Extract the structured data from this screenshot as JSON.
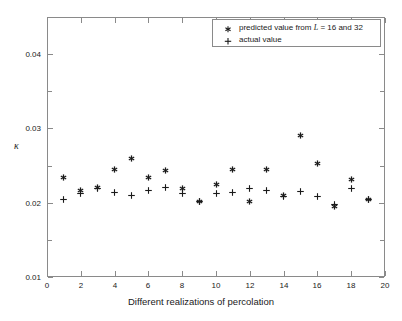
{
  "chart_data": {
    "type": "scatter",
    "title": "",
    "xlabel": "Different realizations of percolation",
    "ylabel": "κ",
    "xlim": [
      0,
      20
    ],
    "ylim": [
      0.01,
      0.045
    ],
    "xticks": [
      0,
      2,
      4,
      6,
      8,
      10,
      12,
      14,
      16,
      18,
      20
    ],
    "xtick_labels": [
      "0",
      "2",
      "4",
      "6",
      "8",
      "10",
      "12",
      "14",
      "16",
      "18",
      "20"
    ],
    "yticks": [
      0.01,
      0.02,
      0.03,
      0.04
    ],
    "ytick_labels": [
      "0.01",
      "0.02",
      "0.03",
      "0.04"
    ],
    "y_minor_ticks": [
      0.015,
      0.025,
      0.035,
      0.045
    ],
    "grid": false,
    "legend_position": "top-right",
    "x": [
      1,
      2,
      3,
      4,
      5,
      6,
      7,
      8,
      9,
      10,
      11,
      12,
      13,
      14,
      15,
      16,
      17,
      18,
      19
    ],
    "series": [
      {
        "name": "predicted value from L = 16 and 32",
        "marker": "star",
        "color": "#1a1a1a",
        "values": [
          0.0234,
          0.0216,
          0.022,
          0.0245,
          0.026,
          0.0234,
          0.0243,
          0.0219,
          0.0201,
          0.0225,
          0.0245,
          0.0201,
          0.0245,
          0.021,
          0.029,
          0.0253,
          0.0195,
          0.0231,
          0.0204
        ]
      },
      {
        "name": "actual value",
        "marker": "plus",
        "color": "#1a1a1a",
        "values": [
          0.0205,
          0.0212,
          0.0219,
          0.0214,
          0.021,
          0.0217,
          0.0221,
          0.0212,
          0.0201,
          0.0213,
          0.0214,
          0.0219,
          0.0217,
          0.0208,
          0.0215,
          0.0208,
          0.0197,
          0.0219,
          0.0204
        ]
      }
    ]
  },
  "legend": {
    "entries": [
      {
        "label_prefix": "predicted value from ",
        "label_italic": "L",
        "label_suffix": " = 16 and 32",
        "marker": "star-marker"
      },
      {
        "label_prefix": "actual value",
        "label_italic": "",
        "label_suffix": "",
        "marker": "plus-marker"
      }
    ]
  },
  "axes": {
    "x_axis_label": "Different realizations of percolation",
    "y_axis_label": "κ"
  }
}
